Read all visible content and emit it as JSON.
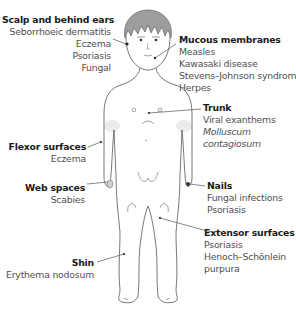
{
  "regions": [
    {
      "id": "scalp",
      "title": "Scalp and behind ears",
      "items": [
        {
          "text": "Seborrhoeic dermatitis"
        },
        {
          "text": "Eczema"
        },
        {
          "text": "Psoriasis"
        },
        {
          "text": "Fungal"
        }
      ]
    },
    {
      "id": "mucous",
      "title": "Mucous membranes",
      "items": [
        {
          "text": "Measles"
        },
        {
          "text": "Kawasaki disease"
        },
        {
          "text": "Stevens–Johnson syndrome"
        },
        {
          "text": "Herpes"
        }
      ]
    },
    {
      "id": "trunk",
      "title": "Trunk",
      "items": [
        {
          "text": "Viral exanthems"
        },
        {
          "text": "Molluscum",
          "italic": true
        },
        {
          "text": "contagiosum",
          "italic": true
        }
      ]
    },
    {
      "id": "flexor",
      "title": "Flexor surfaces",
      "items": [
        {
          "text": "Eczema"
        }
      ]
    },
    {
      "id": "web",
      "title": "Web spaces",
      "items": [
        {
          "text": "Scabies"
        }
      ]
    },
    {
      "id": "nails",
      "title": "Nails",
      "items": [
        {
          "text": "Fungal infections"
        },
        {
          "text": "Psoriasis"
        }
      ]
    },
    {
      "id": "extensor",
      "title": "Extensor surfaces",
      "items": [
        {
          "text": "Psoriasis"
        },
        {
          "text": "Henoch–Schönlein"
        },
        {
          "text": "purpura"
        }
      ]
    },
    {
      "id": "shin",
      "title": "Shin",
      "items": [
        {
          "text": "Erythema nodosum"
        }
      ]
    }
  ],
  "colors": {
    "line": "#555555",
    "hair": "#9a9a9a",
    "shade": "#e6e6e6",
    "text": "#4a4a4a",
    "title": "#1a1a1a"
  }
}
